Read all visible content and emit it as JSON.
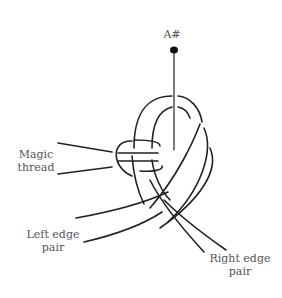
{
  "diagram": {
    "type": "knot-illustration",
    "labels": {
      "pin": "A#",
      "magic_thread_line1": "Magic",
      "magic_thread_line2": "thread",
      "left_edge_line1": "Left edge",
      "left_edge_line2": "pair",
      "right_edge_line1": "Right edge",
      "right_edge_line2": "pair"
    },
    "colors": {
      "stroke": "#222222",
      "text": "#555555",
      "background": "#ffffff"
    }
  }
}
